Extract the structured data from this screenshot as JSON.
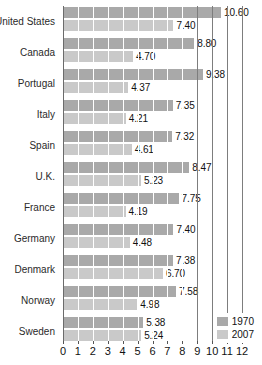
{
  "chart_data": {
    "type": "bar",
    "orientation": "horizontal",
    "title": "",
    "xlabel": "",
    "ylabel": "",
    "xlim": [
      0,
      12
    ],
    "xticks": [
      "0",
      "1",
      "2",
      "3",
      "4",
      "5",
      "6",
      "7",
      "8",
      "9",
      "10",
      "11",
      "12"
    ],
    "grid": true,
    "legend_position": "bottom-right",
    "categories": [
      "United States",
      "Canada",
      "Portugal",
      "Italy",
      "Spain",
      "U.K.",
      "France",
      "Germany",
      "Denmark",
      "Norway",
      "Sweden"
    ],
    "series": [
      {
        "name": "1970",
        "color": "#a9a9a9",
        "values": [
          10.6,
          8.8,
          9.38,
          7.35,
          7.32,
          8.47,
          7.75,
          7.4,
          7.38,
          7.58,
          5.38
        ],
        "labels": [
          "10.60",
          "8.80",
          "9.38",
          "7.35",
          "7.32",
          "8.47",
          "7.75",
          "7.40",
          "7.38",
          "7.58",
          "5.38"
        ]
      },
      {
        "name": "2007",
        "color": "#c9c9c9",
        "values": [
          7.4,
          4.7,
          4.37,
          4.21,
          4.61,
          5.23,
          4.19,
          4.48,
          6.7,
          4.98,
          5.24
        ],
        "labels": [
          "7.40",
          "4.70",
          "4.37",
          "4.21",
          "4.61",
          "5.23",
          "4.19",
          "4.48",
          "6.70",
          "4.98",
          "5.24"
        ]
      }
    ]
  },
  "legend": {
    "items": [
      {
        "label": "1970",
        "color": "#a9a9a9"
      },
      {
        "label": "2007",
        "color": "#c9c9c9"
      }
    ]
  }
}
